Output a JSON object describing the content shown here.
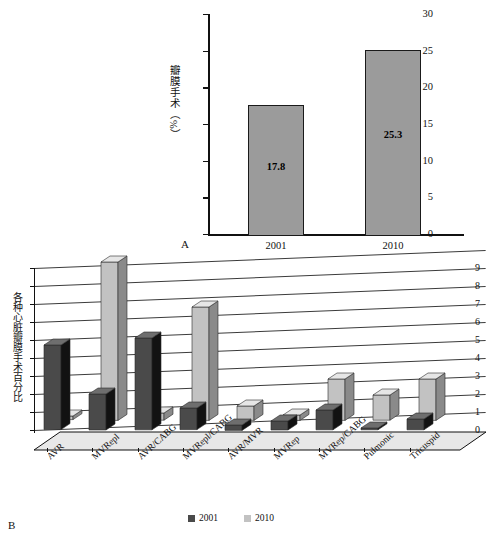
{
  "panelA": {
    "letter": "A",
    "ylabel": "瓣膜手术（%）",
    "yticks": [
      "0",
      "5",
      "10",
      "15",
      "20",
      "25",
      "30"
    ],
    "ylim": [
      0,
      30
    ],
    "categories": [
      "2001",
      "2010"
    ],
    "values": [
      17.8,
      25.3
    ],
    "value_labels": [
      "17.8",
      "25.3"
    ],
    "bar_fill": "#9b9b9b",
    "bar_stroke": "#1a1a1a"
  },
  "panelB": {
    "letter": "B",
    "ylabel": "各种心脏瓣膜手术百分比",
    "yticks": [
      "0",
      "1",
      "2",
      "3",
      "4",
      "5",
      "6",
      "7",
      "8",
      "9"
    ],
    "ylim": [
      0,
      9
    ],
    "categories": [
      "AVR",
      "MVRepl",
      "AVR/CABG",
      "MVRepl/CABG",
      "AVR/MVR",
      "MVRep",
      "MVRep/CABG",
      "Pulmonic",
      "Tricuspid"
    ],
    "legend": [
      {
        "label": "2001",
        "color": "#4a4a4a"
      },
      {
        "label": "2010",
        "color": "#c2c2c2"
      }
    ]
  },
  "chart_data": [
    {
      "type": "bar",
      "panel": "A",
      "title": "",
      "xlabel": "",
      "ylabel": "瓣膜手术（%）",
      "categories": [
        "2001",
        "2010"
      ],
      "values": [
        17.8,
        25.3
      ],
      "data_labels": [
        "17.8",
        "25.3"
      ],
      "ylim": [
        0,
        30
      ],
      "yticks": [
        0,
        5,
        10,
        15,
        20,
        25,
        30
      ],
      "grid": false,
      "legend": "none"
    },
    {
      "type": "bar",
      "panel": "B",
      "title": "",
      "xlabel": "",
      "ylabel": "各种心脏瓣膜手术百分比",
      "categories": [
        "AVR",
        "MVRepl",
        "AVR/CABG",
        "MVRepl/CABG",
        "AVR/MVR",
        "MVRep",
        "MVRep/CABG",
        "Pulmonic",
        "Tricuspid"
      ],
      "series": [
        {
          "name": "2001",
          "color": "#4a4a4a",
          "values": [
            4.7,
            2.0,
            5.1,
            1.2,
            0.3,
            0.5,
            1.1,
            0.1,
            0.6
          ]
        },
        {
          "name": "2010",
          "color": "#c2c2c2",
          "values": [
            0.2,
            8.8,
            0.4,
            6.3,
            0.8,
            0.3,
            2.3,
            1.4,
            2.3
          ]
        }
      ],
      "ylim": [
        0,
        9
      ],
      "yticks": [
        0,
        1,
        2,
        3,
        4,
        5,
        6,
        7,
        8,
        9
      ],
      "grid": true,
      "legend": "bottom",
      "projection": "3d"
    }
  ]
}
